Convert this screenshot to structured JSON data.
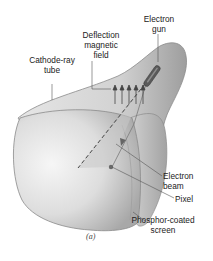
{
  "figure": {
    "caption": "(a)",
    "labels": {
      "electron_gun": [
        "Electron",
        "gun"
      ],
      "deflection_field": [
        "Deflection",
        "magnetic",
        "field"
      ],
      "cathode_ray_tube": [
        "Cathode-ray",
        "tube"
      ],
      "electron_beam": [
        "Electron",
        "beam"
      ],
      "pixel": "Pixel",
      "phosphor_screen": [
        "Phosphor-coated",
        "screen"
      ]
    },
    "colors": {
      "tube_fill": "#d9d9d9",
      "tube_highlight": "#f4f4f4",
      "tube_outline": "#8a8a8a",
      "leader_line": "#555555",
      "gun": "#5a5a5a",
      "pixel": "#6a6a6a"
    }
  }
}
